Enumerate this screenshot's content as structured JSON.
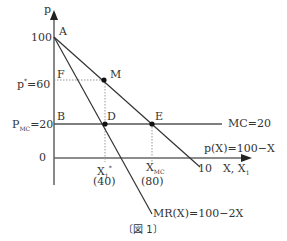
{
  "figure": {
    "caption": "〔図 1〕",
    "axes": {
      "y_label": "p",
      "x_label_main": "X,",
      "x_label_second": "X",
      "x_label_second_sub": "1",
      "x_end_tick": "10"
    },
    "y_ticks": {
      "top": "100",
      "p_star": "p",
      "p_star_sup": "*",
      "p_star_val": "=60",
      "pmc": "P",
      "pmc_sub": "MC",
      "pmc_val": "=20",
      "zero": "0"
    },
    "points": {
      "A": "A",
      "F": "F",
      "M": "M",
      "B": "B",
      "D": "D",
      "E": "E"
    },
    "x_ticks": {
      "x1_star": "X",
      "x1_star_sub": "1",
      "x1_star_sup": "*",
      "x1_star_val": "(40)",
      "xmc": "X",
      "xmc_sub": "MC",
      "xmc_val": "(80)"
    },
    "curves": {
      "mc": "MC=20",
      "demand": "p(X)=100−X",
      "mr": "MR(X)=100−2X"
    },
    "colors": {
      "axis": "#808080",
      "line": "#333333",
      "dotted": "#999999"
    }
  }
}
